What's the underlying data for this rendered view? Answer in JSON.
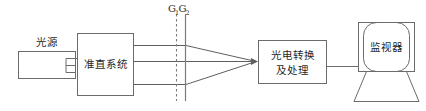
{
  "figure": {
    "title": "",
    "type": "optical-measurement-block-diagram",
    "background_color": "#ffffff",
    "stroke_color": "#6b6b6b",
    "text_color": "#1f1f1f"
  },
  "blocks": [
    {
      "id": "light-source",
      "label": "光源",
      "label_position": "above",
      "shape": "rectangle",
      "x": 18,
      "y": 51,
      "width": 57,
      "height": 27
    },
    {
      "id": "collimation-system",
      "label": "准直系统",
      "label_position": "inside",
      "shape": "rectangle",
      "x": 77,
      "y": 33,
      "width": 56,
      "height": 63
    },
    {
      "id": "photoelectric-conversion",
      "label_line1": "光电转换",
      "label_line2": "及处理",
      "label_position": "inside",
      "shape": "rectangle",
      "x": 258,
      "y": 40,
      "width": 68,
      "height": 44
    },
    {
      "id": "monitor",
      "label": "监视器",
      "label_position": "inside",
      "shape": "crt-monitor",
      "x": 358,
      "y": 22,
      "width": 56,
      "height": 57
    }
  ],
  "gratings": {
    "label_1": "G",
    "label_1_sub": "1",
    "label_2": "G",
    "label_2_sub": "2",
    "dashed_line_x": 176,
    "solid_line_x": 185,
    "line_top": 14,
    "line_bottom": 101
  },
  "beams": {
    "count": 3,
    "description": "three parallel beams from collimation system converging to photoelectric conversion input",
    "y_top": 45,
    "y_mid": 62,
    "y_bottom": 84,
    "start_x": 133,
    "converge_x": 258,
    "converge_y": 62
  },
  "wires": [
    {
      "id": "source-to-collimator",
      "from": "light-source",
      "to": "collimation-system"
    },
    {
      "id": "photoelectric-to-monitor",
      "from": "photoelectric-conversion",
      "to": "monitor"
    }
  ]
}
